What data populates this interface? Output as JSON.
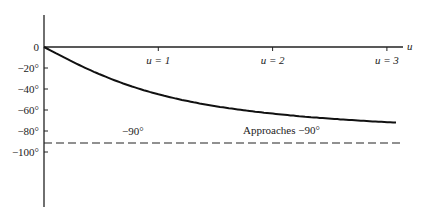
{
  "chart_data": {
    "type": "line",
    "title": "",
    "xlabel": "u",
    "ylabel": "",
    "x_ticks": [
      {
        "value": 1,
        "label": "u = 1"
      },
      {
        "value": 2,
        "label": "u = 2"
      },
      {
        "value": 3,
        "label": "u = 3"
      }
    ],
    "y_ticks": [
      {
        "value": 0,
        "label": "0"
      },
      {
        "value": -20,
        "label": "−20°"
      },
      {
        "value": -40,
        "label": "−40°"
      },
      {
        "value": -60,
        "label": "−60°"
      },
      {
        "value": -80,
        "label": "−80°"
      },
      {
        "value": -100,
        "label": "−100°"
      }
    ],
    "xlim": [
      0,
      3.1
    ],
    "ylim": [
      -100,
      0
    ],
    "grid": false,
    "legend": null,
    "series": [
      {
        "name": "phase = -arctan(u)",
        "style": "solid",
        "x": [
          0,
          0.25,
          0.5,
          0.75,
          1.0,
          1.25,
          1.5,
          1.75,
          2.0,
          2.25,
          2.5,
          2.75,
          3.0,
          3.08
        ],
        "values": [
          0,
          -14.0,
          -26.6,
          -36.9,
          -45.0,
          -51.3,
          -56.3,
          -60.3,
          -63.4,
          -66.0,
          -68.2,
          -70.0,
          -71.6,
          -72.0
        ]
      },
      {
        "name": "asymptote",
        "style": "dashed",
        "x": [
          0,
          3.14
        ],
        "values": [
          -90,
          -90
        ]
      }
    ],
    "annotations": [
      {
        "text": "−90°",
        "x": 0.7,
        "y": -84
      },
      {
        "text": "Approaches  −90°",
        "x": 1.9,
        "y": -83
      }
    ]
  },
  "labels": {
    "axis_u": "u",
    "asymptote_label": "−90°",
    "approach_label": "Approaches  −90°"
  }
}
